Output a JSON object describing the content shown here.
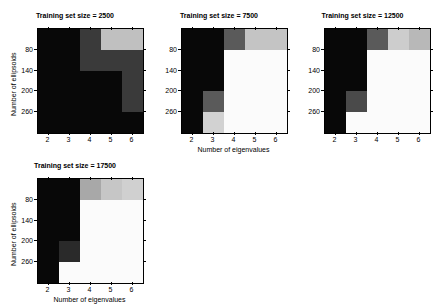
{
  "figure": {
    "background": "#ffffff",
    "panel_count": 4
  },
  "axis_labels": {
    "x": "Number of eigenvalues",
    "y": "Number of ellipsoids"
  },
  "ticks": {
    "x": [
      "2",
      "3",
      "4",
      "5",
      "6"
    ],
    "y": [
      "80",
      "140",
      "200",
      "260"
    ]
  },
  "panels": [
    {
      "title": "Training set size = 2500",
      "show_xlabel": false,
      "show_ylabel": true
    },
    {
      "title": "Training set size = 7500",
      "show_xlabel": true,
      "show_ylabel": false
    },
    {
      "title": "Training set size = 12500",
      "show_xlabel": true,
      "show_ylabel": false
    },
    {
      "title": "Training set size = 17500",
      "show_xlabel": true,
      "show_ylabel": true
    }
  ],
  "chart_data": [
    {
      "type": "heatmap",
      "title": "Training set size = 2500",
      "xlabel": "Number of eigenvalues",
      "ylabel": "Number of ellipsoids",
      "x": [
        2,
        3,
        4,
        5,
        6
      ],
      "y": [
        50,
        110,
        170,
        230,
        290
      ],
      "xticks": [
        2,
        3,
        4,
        5,
        6
      ],
      "yticks": [
        80,
        140,
        200,
        260
      ],
      "xlim": [
        1.5,
        6.5
      ],
      "ylim": [
        20,
        320
      ],
      "grid": false,
      "colormap": "gray",
      "cell_colors": [
        [
          "#080808",
          "#080808",
          "#3a3a3a",
          "#c0c0c0",
          "#c0c0c0"
        ],
        [
          "#080808",
          "#080808",
          "#3a3a3a",
          "#3a3a3a",
          "#3a3a3a"
        ],
        [
          "#080808",
          "#080808",
          "#080808",
          "#080808",
          "#3a3a3a"
        ],
        [
          "#080808",
          "#080808",
          "#080808",
          "#080808",
          "#3a3a3a"
        ],
        [
          "#080808",
          "#080808",
          "#080808",
          "#080808",
          "#080808"
        ]
      ],
      "values": [
        [
          0.03,
          0.03,
          0.23,
          0.75,
          0.75
        ],
        [
          0.03,
          0.03,
          0.23,
          0.23,
          0.23
        ],
        [
          0.03,
          0.03,
          0.03,
          0.03,
          0.23
        ],
        [
          0.03,
          0.03,
          0.03,
          0.03,
          0.23
        ],
        [
          0.03,
          0.03,
          0.03,
          0.03,
          0.03
        ]
      ]
    },
    {
      "type": "heatmap",
      "title": "Training set size = 7500",
      "xlabel": "Number of eigenvalues",
      "ylabel": "Number of ellipsoids",
      "x": [
        2,
        3,
        4,
        5,
        6
      ],
      "y": [
        50,
        110,
        170,
        230,
        290
      ],
      "xticks": [
        2,
        3,
        4,
        5,
        6
      ],
      "yticks": [
        80,
        140,
        200,
        260
      ],
      "xlim": [
        1.5,
        6.5
      ],
      "ylim": [
        20,
        320
      ],
      "grid": false,
      "colormap": "gray",
      "cell_colors": [
        [
          "#080808",
          "#080808",
          "#5a5a5a",
          "#c4c4c4",
          "#c4c4c4"
        ],
        [
          "#080808",
          "#080808",
          "#fbfbfb",
          "#fbfbfb",
          "#fbfbfb"
        ],
        [
          "#080808",
          "#080808",
          "#fbfbfb",
          "#fbfbfb",
          "#fbfbfb"
        ],
        [
          "#080808",
          "#5a5a5a",
          "#fbfbfb",
          "#fbfbfb",
          "#fbfbfb"
        ],
        [
          "#080808",
          "#d2d2d2",
          "#fbfbfb",
          "#fbfbfb",
          "#fbfbfb"
        ]
      ],
      "values": [
        [
          0.03,
          0.03,
          0.35,
          0.77,
          0.77
        ],
        [
          0.03,
          0.03,
          0.98,
          0.98,
          0.98
        ],
        [
          0.03,
          0.03,
          0.98,
          0.98,
          0.98
        ],
        [
          0.03,
          0.35,
          0.98,
          0.98,
          0.98
        ],
        [
          0.03,
          0.82,
          0.98,
          0.98,
          0.98
        ]
      ]
    },
    {
      "type": "heatmap",
      "title": "Training set size = 12500",
      "xlabel": "Number of eigenvalues",
      "ylabel": "Number of ellipsoids",
      "x": [
        2,
        3,
        4,
        5,
        6
      ],
      "y": [
        50,
        110,
        170,
        230,
        290
      ],
      "xticks": [
        2,
        3,
        4,
        5,
        6
      ],
      "yticks": [
        80,
        140,
        200,
        260
      ],
      "xlim": [
        1.5,
        6.5
      ],
      "ylim": [
        20,
        320
      ],
      "grid": false,
      "colormap": "gray",
      "cell_colors": [
        [
          "#080808",
          "#080808",
          "#5a5a5a",
          "#cdcdcd",
          "#b8b8b8"
        ],
        [
          "#080808",
          "#080808",
          "#fbfbfb",
          "#fbfbfb",
          "#fbfbfb"
        ],
        [
          "#080808",
          "#080808",
          "#fbfbfb",
          "#fbfbfb",
          "#fbfbfb"
        ],
        [
          "#080808",
          "#4a4a4a",
          "#fbfbfb",
          "#fbfbfb",
          "#fbfbfb"
        ],
        [
          "#080808",
          "#fbfbfb",
          "#fbfbfb",
          "#fbfbfb",
          "#fbfbfb"
        ]
      ],
      "values": [
        [
          0.03,
          0.03,
          0.35,
          0.8,
          0.72
        ],
        [
          0.03,
          0.03,
          0.98,
          0.98,
          0.98
        ],
        [
          0.03,
          0.03,
          0.98,
          0.98,
          0.98
        ],
        [
          0.03,
          0.29,
          0.98,
          0.98,
          0.98
        ],
        [
          0.03,
          0.98,
          0.98,
          0.98,
          0.98
        ]
      ]
    },
    {
      "type": "heatmap",
      "title": "Training set size = 17500",
      "xlabel": "Number of eigenvalues",
      "ylabel": "Number of ellipsoids",
      "x": [
        2,
        3,
        4,
        5,
        6
      ],
      "y": [
        50,
        110,
        170,
        230,
        290
      ],
      "xticks": [
        2,
        3,
        4,
        5,
        6
      ],
      "yticks": [
        80,
        140,
        200,
        260
      ],
      "xlim": [
        1.5,
        6.5
      ],
      "ylim": [
        20,
        320
      ],
      "grid": false,
      "colormap": "gray",
      "cell_colors": [
        [
          "#080808",
          "#080808",
          "#a8a8a8",
          "#c6c6c6",
          "#d0d0d0"
        ],
        [
          "#080808",
          "#080808",
          "#fbfbfb",
          "#fbfbfb",
          "#fbfbfb"
        ],
        [
          "#080808",
          "#080808",
          "#fbfbfb",
          "#fbfbfb",
          "#fbfbfb"
        ],
        [
          "#080808",
          "#2a2a2a",
          "#fbfbfb",
          "#fbfbfb",
          "#fbfbfb"
        ],
        [
          "#080808",
          "#fbfbfb",
          "#fbfbfb",
          "#fbfbfb",
          "#fbfbfb"
        ]
      ],
      "values": [
        [
          0.03,
          0.03,
          0.66,
          0.78,
          0.81
        ],
        [
          0.03,
          0.03,
          0.98,
          0.98,
          0.98
        ],
        [
          0.03,
          0.03,
          0.98,
          0.98,
          0.98
        ],
        [
          0.03,
          0.16,
          0.98,
          0.98,
          0.98
        ],
        [
          0.03,
          0.98,
          0.98,
          0.98,
          0.98
        ]
      ]
    }
  ]
}
